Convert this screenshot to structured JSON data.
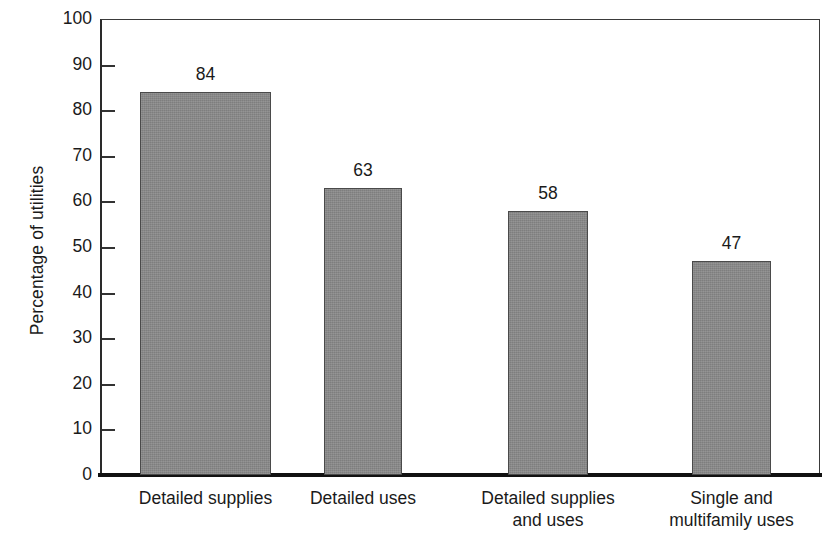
{
  "chart_data": {
    "type": "bar",
    "title": "",
    "xlabel": "",
    "ylabel": "Percentage of utilities",
    "ylim": [
      0,
      100
    ],
    "ytick_step": 10,
    "grid": false,
    "legend": null,
    "bar_color": "#8a8a8a",
    "bar_edge_color": "#4a4a4a",
    "axis_color": "#1a1a1a",
    "categories": [
      "Detailed supplies",
      "Detailed uses",
      "Detailed supplies and uses",
      "Single and multifamily uses"
    ],
    "category_lines": [
      [
        "Detailed supplies"
      ],
      [
        "Detailed uses"
      ],
      [
        "Detailed supplies",
        "and uses"
      ],
      [
        "Single and",
        "multifamily uses"
      ]
    ],
    "values": [
      84,
      63,
      58,
      47
    ],
    "value_labels": [
      "84",
      "63",
      "58",
      "47"
    ],
    "ytick_labels": [
      "100",
      "90",
      "80",
      "70",
      "60",
      "50",
      "40",
      "30",
      "20",
      "10",
      "0"
    ],
    "ytick_values": [
      100,
      90,
      80,
      70,
      60,
      50,
      40,
      30,
      20,
      10,
      0
    ]
  }
}
